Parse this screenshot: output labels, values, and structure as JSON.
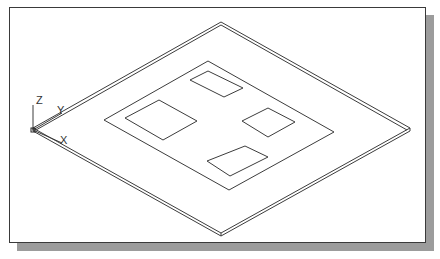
{
  "viewport": {
    "background": "#ffffff",
    "frame_color": "#3a3a3a",
    "shadow_color": "#9c9c9c",
    "line_color": "#3c3c3c"
  },
  "ucs_icon": {
    "z_label": "Z",
    "y_label": "Y",
    "x_label": "X"
  },
  "model": {
    "description": "Isometric view of a thin square plate with an inset rectangular border and four rectangular cutouts",
    "plate_outer_corners": {
      "top": [
        221,
        22
      ],
      "left": [
        33,
        130
      ],
      "right": [
        410,
        130
      ],
      "bottom": [
        221,
        236
      ]
    },
    "plate_thickness_px": 4,
    "inner_border": {
      "top": [
        208,
        61
      ],
      "left": [
        104,
        120
      ],
      "right": [
        334,
        132
      ],
      "bottom": [
        229,
        190
      ]
    },
    "openings": [
      {
        "name": "left",
        "top": [
          159,
          100
        ],
        "left": [
          125,
          118
        ],
        "bottom": [
          163,
          140
        ],
        "right": [
          197,
          121
        ]
      },
      {
        "name": "top",
        "top": [
          208,
          71
        ],
        "left": [
          190,
          80
        ],
        "bottom": [
          224,
          97
        ],
        "right": [
          243,
          88
        ]
      },
      {
        "name": "right",
        "top": [
          268,
          108
        ],
        "left": [
          242,
          121
        ],
        "bottom": [
          268,
          137
        ],
        "right": [
          295,
          122
        ]
      },
      {
        "name": "bottom",
        "top": [
          245,
          146
        ],
        "left": [
          207,
          161
        ],
        "bottom": [
          230,
          176
        ],
        "right": [
          268,
          157
        ]
      }
    ]
  }
}
